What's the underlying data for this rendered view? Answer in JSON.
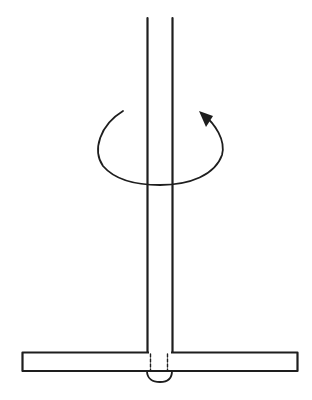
{
  "diagram": {
    "description": "Rotating vertical shaft joined to a horizontal bar (T-shaped), with a circular arrow indicating rotation about the shaft axis",
    "colors": {
      "line": "#1e1e1e",
      "background": "#ffffff"
    },
    "elements": {
      "shaft": {
        "label": "vertical shaft",
        "x_left": 147,
        "x_right": 172,
        "y_top": 18,
        "y_bottom": 352
      },
      "rotation_arrow": {
        "label": "rotation arrow",
        "direction": "counterclockwise (viewed from above)"
      },
      "crossbar": {
        "label": "horizontal bar",
        "x_left": 22,
        "x_right": 297,
        "y_top": 352,
        "y_bottom": 371
      },
      "hidden_lines": {
        "label": "shaft continuation through bar (dashed)"
      },
      "weld_bead": {
        "label": "weld / rivet head below bar"
      }
    }
  }
}
